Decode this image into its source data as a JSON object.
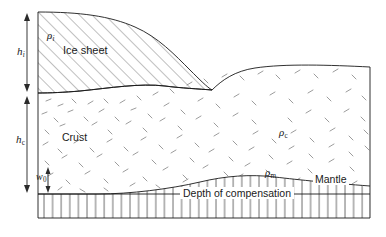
{
  "figure": {
    "type": "geological-cross-section",
    "background_color": "#ffffff",
    "line_color": "#1a1a1a",
    "hatch_color": "#555555",
    "width": 386,
    "height": 237
  },
  "layers": {
    "ice_sheet": {
      "label": "Ice sheet",
      "density_symbol": "ρ",
      "density_subscript": "i",
      "fill_pattern": "diagonal-hatch"
    },
    "crust": {
      "label": "Crust",
      "density_symbol": "ρ",
      "density_subscript": "c",
      "fill_pattern": "random-dashes"
    },
    "mantle": {
      "label": "Mantle",
      "density_symbol": "ρ",
      "density_subscript": "m",
      "fill_pattern": "vertical-lines"
    }
  },
  "measurements": [
    {
      "name": "ice-thickness",
      "symbol": "h",
      "subscript": "i",
      "arrow": "double-headed-vertical"
    },
    {
      "name": "crust-thickness",
      "symbol": "h",
      "subscript": "c",
      "arrow": "double-headed-vertical"
    },
    {
      "name": "root-depression",
      "symbol": "w",
      "subscript": "0",
      "arrow": "double-headed-vertical"
    }
  ],
  "annotations": {
    "depth_of_compensation": "Depth of compensation"
  }
}
